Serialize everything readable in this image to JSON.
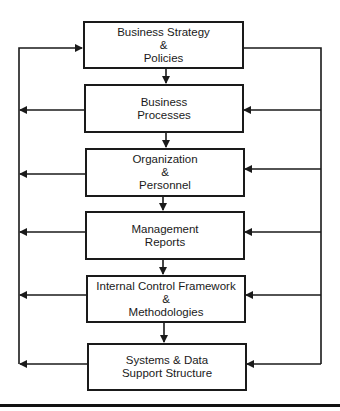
{
  "diagram": {
    "boxes": [
      {
        "lines": [
          "Business Strategy",
          "&",
          "Policies"
        ]
      },
      {
        "lines": [
          "Business",
          "Processes"
        ]
      },
      {
        "lines": [
          "Organization",
          "&",
          "Personnel"
        ]
      },
      {
        "lines": [
          "Management",
          "Reports"
        ]
      },
      {
        "lines": [
          "Internal Control Framework",
          "&",
          "Methodologies"
        ]
      },
      {
        "lines": [
          "Systems & Data",
          "Support Structure"
        ]
      }
    ],
    "colors": {
      "stroke": "#1a1a1a",
      "background": "#ffffff"
    }
  }
}
